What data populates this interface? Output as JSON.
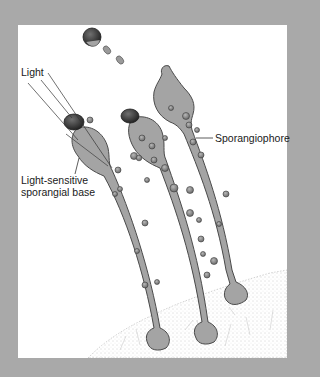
{
  "figure": {
    "colors": {
      "frame": "#a9a9a9",
      "panel": "#ffffff",
      "stalk_fill": "#a4a4a4",
      "stalk_stroke": "#4a4a4a",
      "sporangium_cap": "#3a3a3a",
      "droplet": "#8a8a8a",
      "substrate_stipple": "#9a9a9a",
      "leader_line": "#333333"
    }
  },
  "labels": {
    "light": "Light",
    "base_line1": "Light-sensitive",
    "base_line2": "sporangial base",
    "sporangiophore": "Sporangiophore"
  }
}
